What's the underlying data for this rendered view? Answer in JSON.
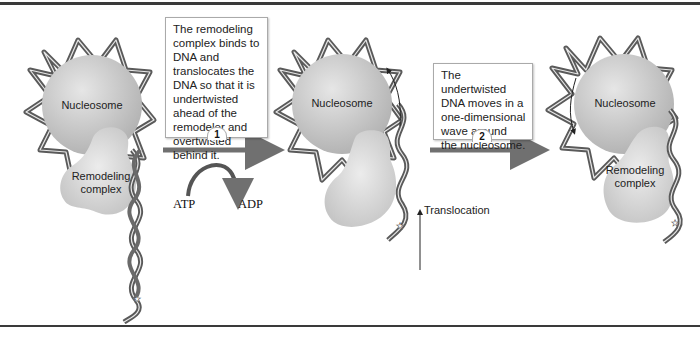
{
  "diagram": {
    "stages": [
      {
        "nucleosome_label": "Nucleosome",
        "remodeler_label": "Remodeling complex",
        "remodeler_line1": "Remodeling",
        "remodeler_line2": "complex"
      },
      {
        "nucleosome_label": "Nucleosome",
        "translocation_label": "Translocation"
      },
      {
        "nucleosome_label": "Nucleosome",
        "remodeler_line1": "Remodeling",
        "remodeler_line2": "complex"
      }
    ],
    "steps": [
      {
        "number": "1",
        "text": "The remodeling complex binds to DNA and translocates the DNA so that it is undertwisted ahead of the remodeler and overtwisted behind it.",
        "input": "ATP",
        "output": "ADP"
      },
      {
        "number": "2",
        "text": "The undertwisted DNA moves in a one-dimensional wave around the nucleosome."
      }
    ],
    "colors": {
      "dna_dark": "#5a5a5a",
      "dna_light": "#e8e8e8",
      "nucleosome": "#c8c8c8",
      "remodeler": "#d6d6d6",
      "arrow": "#707070",
      "border": "#3a3a3a"
    }
  }
}
